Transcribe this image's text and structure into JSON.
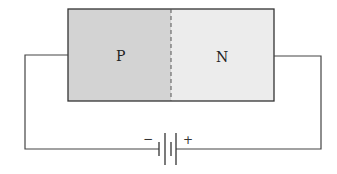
{
  "diagram": {
    "regions": [
      {
        "id": "p-region",
        "label": "P",
        "fill": "#d3d3d3"
      },
      {
        "id": "n-region",
        "label": "N",
        "fill": "#ececec"
      }
    ],
    "battery": {
      "negative_label": "−",
      "positive_label": "+"
    },
    "colors": {
      "outline": "#333333",
      "wire": "#444444",
      "junction": "#555555"
    }
  }
}
